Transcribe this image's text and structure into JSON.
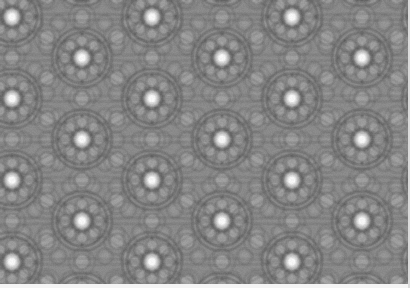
{
  "image": {
    "kind": "grayscale-quasiperiodic-tiling-micrograph",
    "width": 410,
    "height": 288,
    "description": "Dense grayscale ornamental tiling pattern of interlocking circles, rosettes and star motifs with a regular lattice of bright white dots",
    "alt_text": "Repeating gray geometric rosette pattern with bright white dots"
  },
  "palette": {
    "background_gray": "#8a8a8a",
    "line_dark": "#5f5f5f",
    "line_darkest": "#4e4e4e",
    "fill_light": "#9e9e9e",
    "fill_lighter": "#ababab",
    "bright_dot": "#efefef",
    "bright_dot_core": "#f6f6f6",
    "edge_strip": "#f4f4f4",
    "edge_strip_right": "#dcdcdc"
  },
  "lattice": {
    "bright_dot_radius": 5.2,
    "column_period_px": 140,
    "row_period_px": 40.8,
    "row_offset_px": 70,
    "origin_x_px": 12,
    "origin_y_px": 17,
    "bright_dot_count_visible": 21
  },
  "motif": {
    "rosette_outer_radius_px": 30,
    "rosette_petal_count": 8,
    "inner_ring_radius_px": 17,
    "medium_circle_radius_px": 7.5,
    "small_circle_radius_px": 4.2,
    "sub_lattice_spacing_px": 23.3,
    "stroke_width_px": 1.6
  },
  "edges": {
    "bottom_strip_height_px": 4,
    "right_strip_width_px": 2
  }
}
